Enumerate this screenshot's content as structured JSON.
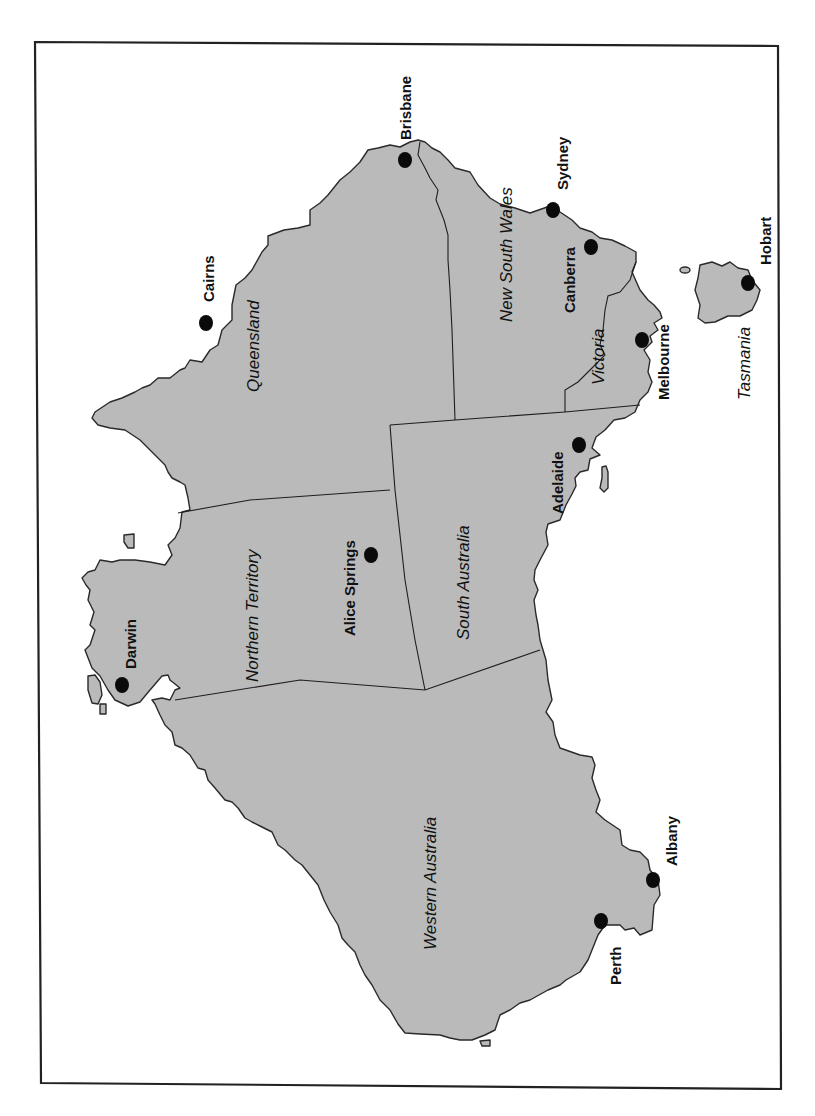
{
  "map": {
    "orientation": "rotated 90 degrees clockwise (north points left)",
    "colors": {
      "land": "#bababa",
      "outline": "#2a2a2a",
      "city": "#0a0a0a",
      "background": "#ffffff"
    },
    "regions": [
      {
        "id": "queensland",
        "label": "Queensland",
        "x": 253,
        "y": 355
      },
      {
        "id": "new-south-wales",
        "label": "New South Wales",
        "x": 506,
        "y": 258
      },
      {
        "id": "victoria",
        "label": "Victoria",
        "x": 598,
        "y": 358
      },
      {
        "id": "tasmania",
        "label": "Tasmania",
        "x": 744,
        "y": 367
      },
      {
        "id": "northern-territory",
        "label": "Northern Territory",
        "x": 251,
        "y": 602
      },
      {
        "id": "south-australia",
        "label": "South Australia",
        "x": 463,
        "y": 585
      },
      {
        "id": "western-australia",
        "label": "Western Australia",
        "x": 430,
        "y": 878
      }
    ],
    "cities": [
      {
        "id": "brisbane",
        "label": "Brisbane",
        "dot": [
          405,
          160
        ],
        "text": [
          401,
          100
        ]
      },
      {
        "id": "sydney",
        "label": "Sydney",
        "dot": [
          553,
          210
        ],
        "text": [
          568,
          160
        ]
      },
      {
        "id": "canberra",
        "label": "Canberra",
        "dot": [
          591,
          247
        ],
        "text": [
          575,
          283
        ]
      },
      {
        "id": "hobart",
        "label": "Hobart",
        "dot": [
          748,
          283
        ],
        "text": [
          770,
          240
        ]
      },
      {
        "id": "melbourne",
        "label": "Melbourne",
        "dot": [
          642,
          340
        ],
        "text": [
          665,
          383
        ]
      },
      {
        "id": "cairns",
        "label": "Cairns",
        "dot": [
          206,
          323
        ],
        "text": [
          200,
          283
        ]
      },
      {
        "id": "adelaide",
        "label": "Adelaide",
        "dot": [
          579,
          445
        ],
        "text": [
          561,
          466
        ]
      },
      {
        "id": "alice-springs",
        "label": "Alice Springs",
        "dot": [
          371,
          555
        ],
        "text": [
          353,
          544
        ]
      },
      {
        "id": "darwin",
        "label": "Darwin",
        "dot": [
          122,
          685
        ],
        "text": [
          128,
          672
        ]
      },
      {
        "id": "albany",
        "label": "Albany",
        "dot": [
          653,
          880
        ],
        "text": [
          677,
          855
        ]
      },
      {
        "id": "perth",
        "label": "Perth",
        "dot": [
          601,
          921
        ],
        "text": [
          620,
          962
        ]
      }
    ]
  }
}
